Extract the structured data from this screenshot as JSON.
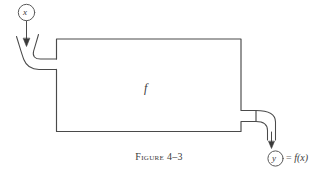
{
  "figure": {
    "caption_word": "Figure",
    "caption_number": "4–3",
    "input_node_label": "x",
    "output_node_label": "y",
    "box_label": "f",
    "output_expression_equals": "=",
    "output_expression_value": "f(x)",
    "ink_color": "#3a3a3a",
    "background_color": "#ffffff"
  }
}
